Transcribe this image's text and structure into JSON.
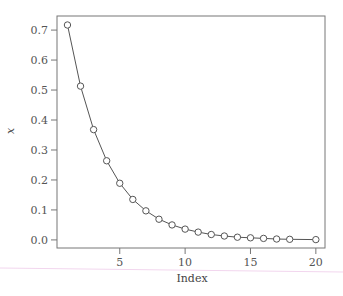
{
  "chart_data": {
    "type": "line",
    "title": "",
    "xlabel": "Index",
    "ylabel": "x",
    "x": [
      1,
      2,
      3,
      4,
      5,
      6,
      7,
      8,
      9,
      10,
      11,
      12,
      13,
      14,
      15,
      16,
      17,
      18,
      20
    ],
    "series": [
      {
        "name": "x",
        "marker": "open-circle",
        "line": true,
        "values": [
          0.717,
          0.513,
          0.368,
          0.264,
          0.189,
          0.135,
          0.097,
          0.069,
          0.05,
          0.036,
          0.026,
          0.018,
          0.013,
          0.009,
          0.007,
          0.005,
          0.003,
          0.002,
          0.001
        ]
      }
    ],
    "xticks": [
      5,
      10,
      15,
      20
    ],
    "xtick_labels": [
      "5",
      "10",
      "15",
      "20"
    ],
    "yticks": [
      0.0,
      0.1,
      0.2,
      0.3,
      0.4,
      0.5,
      0.6,
      0.7
    ],
    "ytick_labels": [
      "0.0",
      "0.1",
      "0.2",
      "0.3",
      "0.4",
      "0.5",
      "0.6",
      "0.7"
    ],
    "xlim": [
      0.2,
      20.7
    ],
    "ylim": [
      -0.027,
      0.747
    ],
    "grid": false,
    "legend": null
  },
  "colors": {
    "line": "#555555",
    "frame": "#777777",
    "marker": "#555555",
    "artifact_line": "#f2d6ee"
  }
}
